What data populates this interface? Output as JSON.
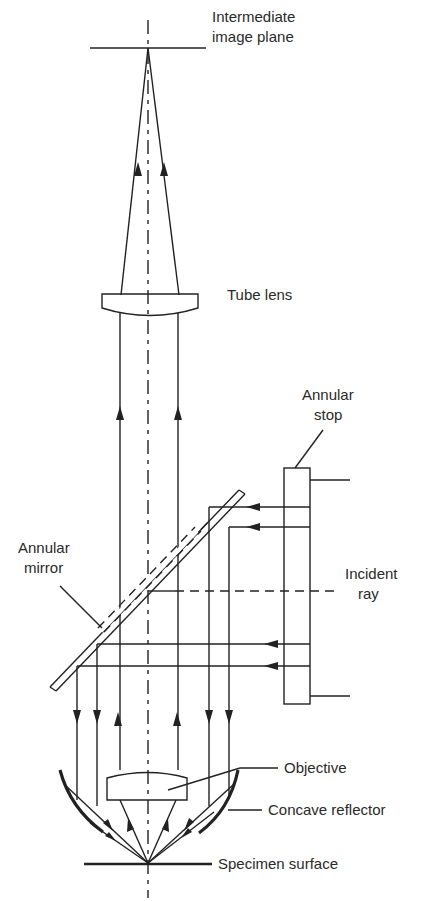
{
  "figure": {
    "colors": {
      "ink": "#222222",
      "text": "#2a2a2a",
      "background": "#ffffff"
    }
  },
  "labels": {
    "intermediate_image_plane": [
      "Intermediate",
      "image plane"
    ],
    "tube_lens": "Tube lens",
    "annular_stop": [
      "Annular",
      "stop"
    ],
    "annular_mirror": [
      "Annular",
      "mirror"
    ],
    "incident_ray": [
      "Incident",
      "ray"
    ],
    "objective": "Objective",
    "concave_reflector": "Concave reflector",
    "specimen_surface": "Specimen surface"
  },
  "components": [
    {
      "id": "intermediate-image-plane",
      "name": "Intermediate image plane"
    },
    {
      "id": "tube-lens",
      "name": "Tube lens"
    },
    {
      "id": "annular-stop",
      "name": "Annular stop"
    },
    {
      "id": "annular-mirror",
      "name": "Annular mirror"
    },
    {
      "id": "objective",
      "name": "Objective"
    },
    {
      "id": "concave-reflector",
      "name": "Concave reflector"
    },
    {
      "id": "specimen-surface",
      "name": "Specimen surface"
    }
  ],
  "rays": {
    "incident_direction": "leftward",
    "illumination_direction": "downward",
    "imaging_direction": "upward"
  }
}
